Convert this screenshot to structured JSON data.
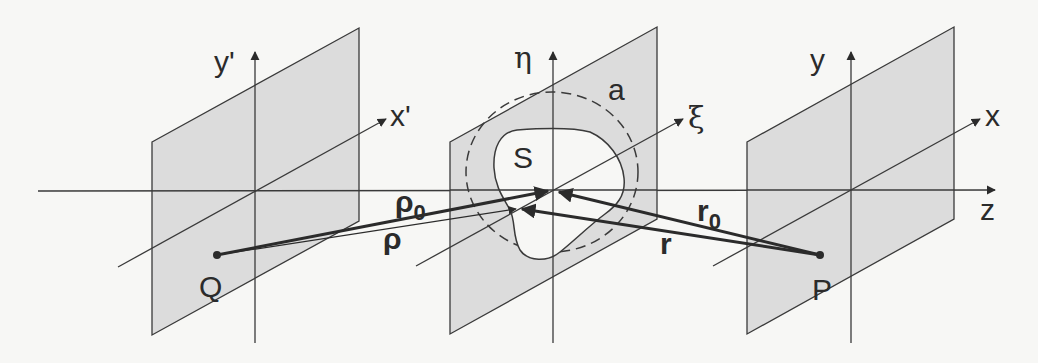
{
  "figure": {
    "colors": {
      "background": "#f7f7f5",
      "plane_fill": "#dcdcdc",
      "line": "#3a3a3a",
      "ink": "#2b2b2b"
    }
  },
  "planes": {
    "source": {
      "horizontal_axis_label": "x'",
      "vertical_axis_label": "y'",
      "point_label": "Q"
    },
    "aperture": {
      "horizontal_axis_label": "ξ",
      "vertical_axis_label": "η",
      "aperture_label": "S",
      "radius_label": "a"
    },
    "observation": {
      "horizontal_axis_label": "x",
      "vertical_axis_label": "y",
      "point_label": "P"
    }
  },
  "optical_axis": {
    "label": "z"
  },
  "vectors": {
    "rho0": {
      "base": "ρ",
      "subscript": "0"
    },
    "rho": {
      "label": "ρ"
    },
    "r0": {
      "base": "r",
      "subscript": "0"
    },
    "r": {
      "label": "r"
    }
  }
}
